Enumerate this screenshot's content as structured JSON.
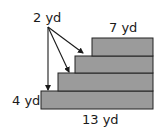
{
  "diagram": {
    "type": "staircase-dimensions",
    "labels": {
      "step_height": "2 yd",
      "top_width": "7 yd",
      "bottom_height": "4 yd",
      "bottom_width": "13 yd"
    },
    "colors": {
      "fill": "#9b9b9b",
      "stroke": "#222222",
      "text": "#1a1a1a"
    },
    "steps": [
      {
        "name": "step-1",
        "x": 41,
        "y": 91,
        "w": 112,
        "h": 18
      },
      {
        "name": "step-2",
        "x": 58,
        "y": 73,
        "w": 95,
        "h": 18
      },
      {
        "name": "step-3",
        "x": 75,
        "y": 56,
        "w": 78,
        "h": 17
      },
      {
        "name": "step-4",
        "x": 92,
        "y": 38,
        "w": 61,
        "h": 18
      }
    ]
  }
}
